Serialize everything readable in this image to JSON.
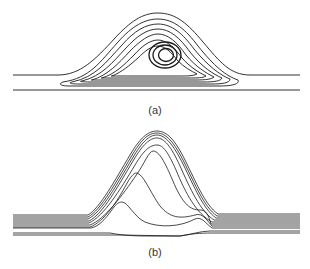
{
  "figure": {
    "panels": [
      {
        "label": "(a)",
        "description": "Streamlines over a hill with a closed recirculation vortex inside",
        "stroke_color": "#1a1a1a",
        "open_lines": [
          "M13,75 L58,75 C80,75 95,60 115,38 C130,22 142,13 158,13 C176,13 188,24 203,42 C220,62 230,75 250,75 L300,75",
          "M13,90 L300,90"
        ],
        "closed_loops": [
          "M63,82 C90,78 100,62 118,42 C132,26 145,19 158,19 C174,19 186,30 198,46 C214,66 226,76 238,80 C240,84 232,86 220,86 L70,86 C60,86 58,84 63,82 Z",
          "M72,82 C96,77 106,62 122,45 C134,31 146,24 158,24 C172,24 183,34 194,49 C208,66 220,75 230,79 C230,83 222,84 212,84 L80,84 C70,84 68,83 72,82 Z",
          "M82,81 C102,76 112,63 126,48 C137,36 147,29 158,29 C170,29 180,38 190,52 C202,67 213,74 222,78 C221,81 214,82 204,82 L90,82 C80,82 79,81 82,81 Z",
          "M92,80 C108,75 118,64 130,51 C140,41 149,34 158,34 C168,34 177,42 186,55 C196,67 206,73 214,77 C212,79 206,80 196,80 L100,80 C92,80 90,80 92,80 Z",
          "M102,78 C115,74 124,65 134,55 C142,46 150,40 158,40 C166,40 174,47 182,58 C190,67 198,72 206,76 C203,78 197,78 188,78 L110,78 C102,78 100,78 102,78 Z",
          "M112,76 C122,72 130,65 138,58 C145,51 151,46 158,46 C165,46 171,52 178,61 C184,67 191,71 197,74 C193,76 188,76 180,76 L118,76 C112,76 110,76 112,76 Z"
        ],
        "vortex_rings": [
          {
            "cx": 165,
            "cy": 55,
            "rx": 16,
            "ry": 13
          },
          {
            "cx": 165,
            "cy": 55,
            "rx": 12,
            "ry": 10
          },
          {
            "cx": 166,
            "cy": 55,
            "rx": 7.5,
            "ry": 6.5
          }
        ]
      },
      {
        "label": "(b)",
        "description": "Streamlines over a hill without recirculation, lines converging near the crest",
        "stroke_color": "#1a1a1a",
        "open_lines": [
          "M13,215 L88,215 C100,208 115,180 130,155 C140,138 148,131 157,131 C167,131 175,140 185,160 C196,182 205,205 218,214 L300,214",
          "M13,217 L88,217 C101,210 116,182 131,157 C141,140 148,133 157,133 C166,133 174,142 184,162 C195,184 204,207 217,216 L300,216",
          "M13,219 L88,219 C102,212 117,184 132,159 C142,142 149,135 157,135 C165,135 173,144 183,164 C194,186 203,209 216,218 L300,218",
          "M13,221 L89,221 C103,214 118,186 133,161 C143,144 150,138 157,138 C164,138 171,146 180,166 C190,188 200,211 214,220 L300,220",
          "M13,223 L89,223 C104,216 120,190 135,165 C144,150 150,145 157,145 C163,145 168,152 176,170 C186,194 196,213 212,222 L300,222",
          "M13,225 L90,225 C105,219 122,196 137,174 C144,164 149,151 153,151 C161,151 168,170 176,188 C184,204 190,210 200,210 C206,210 208,214 211,224 L300,224",
          "M13,227 L90,227 C104,222 118,200 126,185 C131,176 134,173 136,173 C143,173 150,192 160,206 C170,218 180,219 195,215 C203,212 208,222 212,226 L300,226",
          "M13,228 L91,228 C101,226 108,215 114,207 C117,203 120,202 122,202 C128,202 134,217 145,222 C160,228 180,227 195,219 C202,216 206,224 212,228 L300,228",
          "M13,233 L110,233 C125,236 140,236 150,236 L180,236 C190,235 200,231 210,231 L300,231",
          "M13,235 L120,235 L180,236 C195,233 205,233 215,233 L300,233"
        ],
        "closed_loops": [],
        "vortex_rings": []
      }
    ]
  }
}
